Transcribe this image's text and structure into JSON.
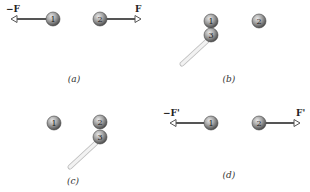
{
  "colors": {
    "ball_light": "#d8d8d8",
    "ball_dark": "#5a5a5a",
    "arrow": "#555555",
    "rod_light": "#f2f2f2",
    "rod_edge": "#bdbdbd"
  },
  "panels": [
    {
      "id": "a",
      "caption": "(a)",
      "balls": [
        {
          "label": "1",
          "cx": 53,
          "cy": 19
        },
        {
          "label": "2",
          "cx": 100,
          "cy": 19
        }
      ],
      "arrows": [
        {
          "from": [
            46,
            19
          ],
          "to": [
            11,
            19
          ],
          "label": "−F",
          "lx": 6,
          "ly": 12
        },
        {
          "from": [
            107,
            19
          ],
          "to": [
            141,
            19
          ],
          "label": "F",
          "lx": 135,
          "ly": 12
        }
      ],
      "caption_pos": [
        74,
        82
      ]
    },
    {
      "id": "b",
      "caption": "(b)",
      "balls": [
        {
          "label": "1",
          "cx": 211,
          "cy": 21
        },
        {
          "label": "3",
          "cx": 211,
          "cy": 35
        },
        {
          "label": "2",
          "cx": 259,
          "cy": 21
        }
      ],
      "rod": {
        "from": [
          207,
          41
        ],
        "to": [
          182,
          64
        ]
      },
      "caption_pos": [
        229,
        82
      ]
    },
    {
      "id": "c",
      "caption": "(c)",
      "balls": [
        {
          "label": "1",
          "cx": 54,
          "cy": 123
        },
        {
          "label": "2",
          "cx": 100,
          "cy": 122
        },
        {
          "label": "3",
          "cx": 100,
          "cy": 137
        }
      ],
      "rod": {
        "from": [
          96,
          143
        ],
        "to": [
          70,
          167
        ]
      },
      "caption_pos": [
        73,
        184
      ]
    },
    {
      "id": "d",
      "caption": "(d)",
      "balls": [
        {
          "label": "1",
          "cx": 211,
          "cy": 123
        },
        {
          "label": "2",
          "cx": 259,
          "cy": 123
        }
      ],
      "arrows": [
        {
          "from": [
            204,
            123
          ],
          "to": [
            170,
            123
          ],
          "label": "−F'",
          "lx": 163,
          "ly": 116
        },
        {
          "from": [
            266,
            123
          ],
          "to": [
            300,
            123
          ],
          "label": "F'",
          "lx": 296,
          "ly": 116
        }
      ],
      "caption_pos": [
        229,
        178
      ]
    }
  ]
}
